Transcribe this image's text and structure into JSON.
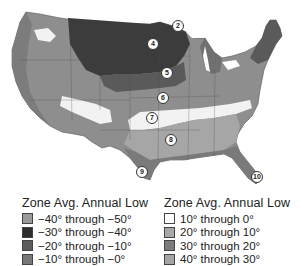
{
  "map": {
    "subject": "USDA plant hardiness zones of the contiguous United States",
    "zone_markers": [
      {
        "label": "2",
        "x": 178,
        "y": 26
      },
      {
        "label": "4",
        "x": 153,
        "y": 44
      },
      {
        "label": "5",
        "x": 167,
        "y": 73
      },
      {
        "label": "6",
        "x": 163,
        "y": 98
      },
      {
        "label": "7",
        "x": 152,
        "y": 118
      },
      {
        "label": "8",
        "x": 171,
        "y": 140
      },
      {
        "label": "9",
        "x": 142,
        "y": 172
      },
      {
        "label": "10",
        "x": 257,
        "y": 177
      }
    ]
  },
  "legend_left": {
    "title": "Zone Avg. Annual Low",
    "items": [
      {
        "label": "−40° through −50°",
        "color": "#9a9a9a"
      },
      {
        "label": "−30° through −40°",
        "color": "#2e2e2e"
      },
      {
        "label": "−20° through −10°",
        "color": "#5c5c5c"
      },
      {
        "label": "−10° through −0°",
        "color": "#787878"
      }
    ]
  },
  "legend_right": {
    "title": "Zone Avg. Annual Low",
    "items": [
      {
        "label": "10° through 0°",
        "color": "#ffffff"
      },
      {
        "label": "20° through 10°",
        "color": "#a8a8a8"
      },
      {
        "label": "30° through 20°",
        "color": "#7c7c7c"
      },
      {
        "label": "40° through 30°",
        "color": "#a4a4a4"
      }
    ]
  }
}
